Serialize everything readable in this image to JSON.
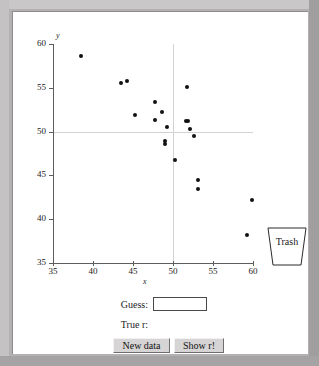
{
  "app": {
    "title": "Correlation Guessing Applet"
  },
  "trash": {
    "label": "Trash",
    "icon": "trash-bin-icon"
  },
  "controls": {
    "guess_label": "Guess:",
    "guess_value": "",
    "guess_placeholder": "",
    "true_r_label": "True r:",
    "true_r_value": "",
    "new_data_label": "New data",
    "show_r_label": "Show r!"
  },
  "chart_data": {
    "type": "scatter",
    "title": "",
    "xlabel": "x",
    "ylabel": "y",
    "xlim": [
      35,
      60
    ],
    "ylim": [
      35,
      60
    ],
    "xticks": [
      35,
      40,
      45,
      50,
      55,
      60
    ],
    "yticks": [
      35,
      40,
      45,
      50,
      55,
      60
    ],
    "grid": false,
    "reference_lines": {
      "x": 50,
      "y": 50,
      "color": "#d2d2d2"
    },
    "marker_color": "#111111",
    "points": [
      {
        "x": 38.5,
        "y": 58.6
      },
      {
        "x": 43.5,
        "y": 55.5
      },
      {
        "x": 44.2,
        "y": 55.8
      },
      {
        "x": 45.2,
        "y": 51.9
      },
      {
        "x": 47.7,
        "y": 53.4
      },
      {
        "x": 47.8,
        "y": 51.3
      },
      {
        "x": 48.6,
        "y": 52.2
      },
      {
        "x": 49.3,
        "y": 50.5
      },
      {
        "x": 49.0,
        "y": 48.9
      },
      {
        "x": 49.0,
        "y": 48.6
      },
      {
        "x": 50.3,
        "y": 46.8
      },
      {
        "x": 51.7,
        "y": 55.1
      },
      {
        "x": 51.6,
        "y": 51.2
      },
      {
        "x": 51.9,
        "y": 51.2
      },
      {
        "x": 52.1,
        "y": 50.3
      },
      {
        "x": 52.6,
        "y": 49.5
      },
      {
        "x": 53.1,
        "y": 44.5
      },
      {
        "x": 53.1,
        "y": 43.5
      },
      {
        "x": 59.9,
        "y": 42.2
      },
      {
        "x": 59.3,
        "y": 38.2
      }
    ]
  }
}
